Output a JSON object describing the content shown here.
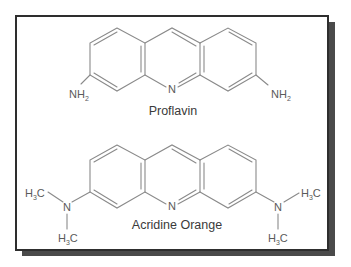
{
  "figure": {
    "molecules": [
      {
        "name": "Proflavin",
        "substituent_left": {
          "main": "NH",
          "sub": "2"
        },
        "substituent_right": {
          "main": "NH",
          "sub": "2"
        },
        "ring_atom": "N"
      },
      {
        "name": "Acridine Orange",
        "ring_atom": "N",
        "left_amine": {
          "atom": "N",
          "methyl_top": {
            "h": "H",
            "sub": "3",
            "c": "C"
          },
          "methyl_bottom": {
            "h": "H",
            "sub": "3",
            "c": "C"
          }
        },
        "right_amine": {
          "atom": "N",
          "methyl_top": {
            "h": "H",
            "sub": "3",
            "c": "C"
          },
          "methyl_bottom": {
            "h": "H",
            "sub": "3",
            "c": "C"
          }
        }
      }
    ],
    "colors": {
      "frame_border": "#2e2e2e",
      "shadow": "#4a4a4a",
      "bond": "#8a8a8a",
      "text": "#3a3a3a"
    }
  }
}
